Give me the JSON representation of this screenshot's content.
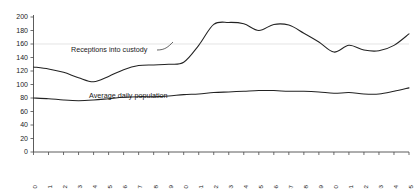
{
  "chart_data": {
    "type": "line",
    "title": "",
    "subtitle": "",
    "xlabel": "",
    "ylabel": "",
    "ylim": [
      0,
      200
    ],
    "ytick_step": 20,
    "yticks": [
      0,
      20,
      40,
      60,
      80,
      100,
      120,
      140,
      160,
      180,
      200
    ],
    "grid": "single horizontal gridline at 160",
    "gridlines": [
      160
    ],
    "legend_position": "inline-annotation",
    "categories": [
      "1970",
      "1971",
      "1972",
      "1973",
      "1974",
      "1975",
      "1976",
      "1977",
      "1978",
      "1979",
      "1980",
      "1981",
      "1982",
      "1983",
      "1984",
      "1985",
      "1986",
      "1987",
      "1988",
      "1989",
      "1990",
      "1991",
      "1992",
      "1993",
      "1994",
      "1995"
    ],
    "series": [
      {
        "name": "Receptions into custody",
        "color": "#222222",
        "values": [
          126,
          123,
          118,
          110,
          104,
          112,
          122,
          128,
          129,
          130,
          133,
          158,
          189,
          192,
          190,
          180,
          189,
          188,
          176,
          163,
          148,
          158,
          151,
          150,
          158,
          175
        ]
      },
      {
        "name": "Average daily population",
        "color": "#222222",
        "values": [
          80,
          79,
          77,
          76,
          77,
          79,
          81,
          82,
          82,
          83,
          85,
          86,
          88,
          89,
          90,
          91,
          91,
          90,
          90,
          89,
          87,
          88,
          86,
          86,
          90,
          95
        ]
      }
    ]
  },
  "annotations": {
    "receptions_label": "Receptions into custody",
    "population_label": "Average daily population"
  },
  "axes": {
    "y_axis_name": "y-axis",
    "x_axis_name": "x-axis"
  }
}
